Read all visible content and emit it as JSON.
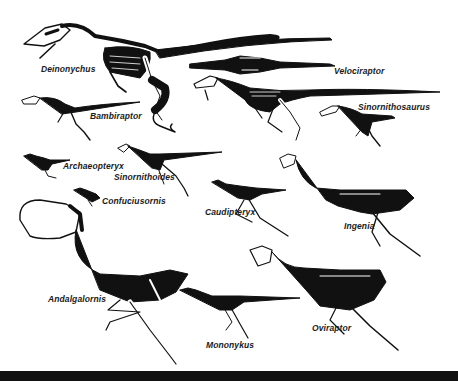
{
  "figure": {
    "background": "#ffffff",
    "ink_color": "#111111",
    "bottom_bar_color": "#111111"
  },
  "specimens": [
    {
      "id": "deinonychus",
      "label": "Deinonychus"
    },
    {
      "id": "velociraptor",
      "label": "Velociraptor"
    },
    {
      "id": "bambiraptor",
      "label": "Bambiraptor"
    },
    {
      "id": "sinornithosaurus",
      "label": "Sinornithosaurus"
    },
    {
      "id": "archaeopteryx",
      "label": "Archaeopteryx"
    },
    {
      "id": "sinornithoides",
      "label": "Sinornithoides"
    },
    {
      "id": "confuciusornis",
      "label": "Confuciusornis"
    },
    {
      "id": "caudipteryx",
      "label": "Caudipteryx"
    },
    {
      "id": "ingenia",
      "label": "Ingenia"
    },
    {
      "id": "andalgalornis",
      "label": "Andalgalornis"
    },
    {
      "id": "mononykus",
      "label": "Mononykus"
    },
    {
      "id": "oviraptor",
      "label": "Oviraptor"
    }
  ]
}
